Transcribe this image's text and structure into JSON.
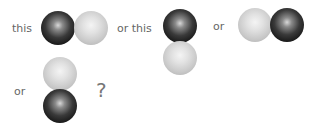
{
  "options": [
    {
      "label": "this",
      "arrangement": "horizontal",
      "order": [
        "dark",
        "light"
      ]
    },
    {
      "label": "or this",
      "arrangement": "vertical",
      "order": [
        "dark",
        "light"
      ]
    },
    {
      "label": "or",
      "arrangement": "horizontal",
      "order": [
        "light",
        "dark"
      ]
    },
    {
      "label": "or",
      "arrangement": "vertical",
      "order": [
        "light",
        "dark"
      ]
    }
  ],
  "question_mark": "?",
  "colors": {
    "dark_sphere": "#1a1a1a",
    "light_sphere": "#cccccc",
    "text": "#666666"
  }
}
